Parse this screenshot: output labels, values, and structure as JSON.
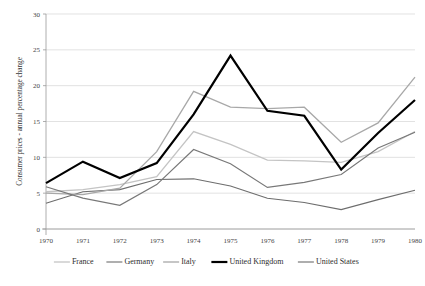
{
  "chart_data": {
    "type": "line",
    "title": "",
    "subtitle": "",
    "xlabel": "",
    "ylabel": "Consumer prices - annual percentage change",
    "x": [
      1970,
      1971,
      1972,
      1973,
      1974,
      1975,
      1976,
      1977,
      1978,
      1979,
      1980
    ],
    "xticklabels": [
      "1970",
      "1971",
      "1972",
      "1973",
      "1974",
      "1975",
      "1976",
      "1977",
      "1978",
      "1979",
      "1980"
    ],
    "yticks": [
      0,
      5,
      10,
      15,
      20,
      25,
      30
    ],
    "yticklabels": [
      "0",
      "5",
      "10",
      "15",
      "20",
      "25",
      "30"
    ],
    "ylim": [
      0,
      30
    ],
    "xlim": [
      1970,
      1980
    ],
    "grid": "horizontal",
    "legend_position": "bottom",
    "series": [
      {
        "name": "France",
        "color": "#c4c4c4",
        "width": 1.3,
        "values": [
          5.2,
          5.5,
          6.2,
          7.3,
          13.6,
          11.8,
          9.6,
          9.5,
          9.3,
          10.8,
          13.6
        ]
      },
      {
        "name": "Germany",
        "color": "#6d6d6d",
        "width": 1.1,
        "values": [
          3.6,
          5.2,
          5.5,
          6.9,
          7.0,
          6.0,
          4.3,
          3.7,
          2.7,
          4.1,
          5.4
        ]
      },
      {
        "name": "Italy",
        "color": "#a8a8a8",
        "width": 1.3,
        "values": [
          5.0,
          4.8,
          5.7,
          10.8,
          19.2,
          17.0,
          16.8,
          17.0,
          12.1,
          14.8,
          21.2
        ]
      },
      {
        "name": "United Kingdom",
        "color": "#000000",
        "width": 2.2,
        "values": [
          6.4,
          9.4,
          7.1,
          9.2,
          16.0,
          24.2,
          16.5,
          15.8,
          8.3,
          13.4,
          18.0
        ]
      },
      {
        "name": "United States",
        "color": "#787878",
        "width": 1.2,
        "values": [
          5.9,
          4.3,
          3.3,
          6.2,
          11.1,
          9.1,
          5.8,
          6.5,
          7.6,
          11.3,
          13.5
        ]
      }
    ]
  },
  "legend": {
    "items": [
      {
        "label": "France"
      },
      {
        "label": "Germany"
      },
      {
        "label": "Italy"
      },
      {
        "label": "United Kingdom"
      },
      {
        "label": "United States"
      }
    ]
  }
}
